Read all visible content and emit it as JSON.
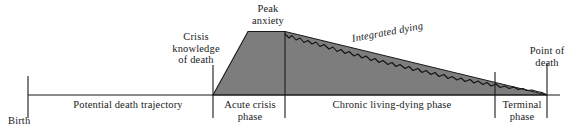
{
  "diagram": {
    "colors": {
      "fill": "#7d7d7d",
      "stroke": "#1a1a1a",
      "axis": "#1a1a1a",
      "background": "#ffffff"
    },
    "callouts": [
      {
        "id": "peak-anxiety",
        "text": "Peak\nanxiety"
      },
      {
        "id": "crisis-knowledge-of-death",
        "text": "Crisis\nknowledge\nof death"
      },
      {
        "id": "integrated-dying",
        "text": "Integrated dying"
      },
      {
        "id": "point-of-death",
        "text": "Point of\ndeath"
      }
    ],
    "axis": {
      "origin_label": "Birth",
      "end_label": "Point of\ndeath"
    },
    "phases": [
      {
        "id": "potential-death-trajectory",
        "label": "Potential death trajectory"
      },
      {
        "id": "acute-crisis-phase",
        "label": "Acute crisis\nphase"
      },
      {
        "id": "chronic-living-dying-phase",
        "label": "Chronic living-dying phase"
      },
      {
        "id": "terminal-phase",
        "label": "Terminal\nphase"
      }
    ]
  }
}
